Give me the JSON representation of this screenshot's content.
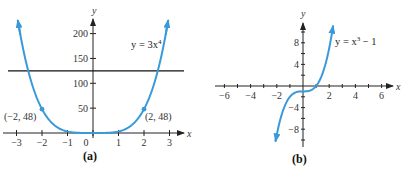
{
  "chart_data": [
    {
      "type": "line",
      "title": "",
      "caption": "(a)",
      "function": "y = 3x^4",
      "equation_label": {
        "prefix": "y = 3x",
        "exp": "4"
      },
      "xlabel": "x",
      "ylabel": "y",
      "xlim": [
        -3.1,
        3.2
      ],
      "ylim": [
        0,
        240
      ],
      "x_ticks": [
        -3,
        -2,
        -1,
        0,
        1,
        2,
        3
      ],
      "x_tick_labels": [
        "−3",
        "−2",
        "−1",
        "0",
        "1",
        "2",
        "3"
      ],
      "y_ticks": [
        50,
        100,
        150,
        200
      ],
      "y_tick_labels": [
        "50",
        "100",
        "150",
        "200"
      ],
      "grid": false,
      "series": [
        {
          "name": "y = 3x^4",
          "color": "#3a9ad9",
          "x": [
            -2.95,
            -2.5,
            -2,
            -1.5,
            -1,
            -0.5,
            0,
            0.5,
            1,
            1.5,
            2,
            2.5,
            2.95
          ],
          "y": [
            227.1,
            117.2,
            48,
            15.2,
            3,
            0.19,
            0,
            0.19,
            3,
            15.2,
            48,
            117.2,
            227.1
          ]
        }
      ],
      "horizontal_line": {
        "y": 125,
        "color": "#111111"
      },
      "annotations": [
        {
          "x": -2,
          "y": 48,
          "label": "(−2, 48)"
        },
        {
          "x": 2,
          "y": 48,
          "label": "(2, 48)"
        }
      ]
    },
    {
      "type": "line",
      "title": "",
      "caption": "(b)",
      "function": "y = x^3 − 1",
      "equation_label": {
        "prefix": "y = x",
        "exp": "3",
        "suffix": " − 1"
      },
      "xlabel": "x",
      "ylabel": "y",
      "xlim": [
        -6.5,
        6.8
      ],
      "ylim": [
        -11,
        12
      ],
      "x_ticks": [
        -6,
        -4,
        -2,
        2,
        4,
        6
      ],
      "x_tick_labels": [
        "−6",
        "−4",
        "−2",
        "2",
        "4",
        "6"
      ],
      "y_ticks": [
        8,
        4,
        -4,
        -8
      ],
      "y_tick_labels": [
        "8",
        "4",
        "−4",
        "−8"
      ],
      "grid": false,
      "series": [
        {
          "name": "y = x^3 − 1",
          "color": "#3a9ad9",
          "x": [
            -2.1,
            -1.5,
            -1,
            -0.5,
            0,
            0.5,
            1,
            1.5,
            2,
            2.3
          ],
          "y": [
            -10.26,
            -4.38,
            -2,
            -1.13,
            -1,
            -0.88,
            0,
            2.38,
            7,
            11.17
          ]
        }
      ]
    }
  ],
  "captions": {
    "a": "(a)",
    "b": "(b)"
  }
}
